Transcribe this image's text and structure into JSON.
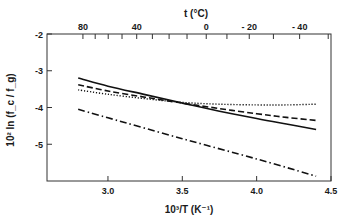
{
  "chart_data": {
    "type": "line",
    "title": "",
    "xlabel": "10³/T (K⁻¹)",
    "ylabel": "10² ln (f_c / f_g)",
    "top_xlabel": "t (°C)",
    "xlim": [
      2.59,
      4.5
    ],
    "ylim": [
      -6.0,
      -2.0
    ],
    "x_ticks": [
      3.0,
      3.5,
      4.0,
      4.5
    ],
    "x_tick_labels": [
      "3.0",
      "3.5",
      "4.0",
      "4.5"
    ],
    "y_ticks": [
      -2,
      -3,
      -4,
      -5
    ],
    "y_tick_labels": [
      "-2",
      "-3",
      "-4",
      "-5"
    ],
    "top_ticks_celsius": [
      80,
      70,
      60,
      50,
      40,
      30,
      20,
      10,
      0,
      -10,
      -20,
      -30,
      -40,
      -50
    ],
    "top_tick_labels": [
      {
        "t": 80,
        "label": "80"
      },
      {
        "t": 40,
        "label": "40"
      },
      {
        "t": 0,
        "label": "0"
      },
      {
        "t": -20,
        "label": "- 20"
      },
      {
        "t": -40,
        "label": "- 40"
      }
    ],
    "grid": false,
    "legend": null,
    "series": [
      {
        "name": "dash-dot",
        "style": "dashdot",
        "x": [
          2.8,
          3.0,
          3.5,
          4.0,
          4.4
        ],
        "y": [
          -4.05,
          -4.28,
          -4.85,
          -5.4,
          -5.87
        ]
      },
      {
        "name": "solid",
        "style": "solid",
        "x": [
          2.8,
          3.0,
          3.25,
          3.5,
          3.75,
          4.0,
          4.2,
          4.4
        ],
        "y": [
          -3.2,
          -3.42,
          -3.65,
          -3.88,
          -4.1,
          -4.3,
          -4.45,
          -4.6
        ]
      },
      {
        "name": "dashed",
        "style": "dashed",
        "x": [
          2.8,
          3.0,
          3.25,
          3.5,
          3.75,
          4.0,
          4.2,
          4.4
        ],
        "y": [
          -3.38,
          -3.55,
          -3.72,
          -3.88,
          -4.03,
          -4.17,
          -4.27,
          -4.35
        ]
      },
      {
        "name": "dotted",
        "style": "dotted",
        "x": [
          2.8,
          3.0,
          3.25,
          3.5,
          3.75,
          4.0,
          4.2,
          4.4
        ],
        "y": [
          -3.52,
          -3.64,
          -3.76,
          -3.86,
          -3.91,
          -3.93,
          -3.93,
          -3.91
        ]
      }
    ]
  },
  "layout": {
    "plot_left": 47,
    "plot_right": 331,
    "plot_top": 34,
    "plot_bottom": 181,
    "line_color": "#111111",
    "axis_color": "#333333"
  }
}
